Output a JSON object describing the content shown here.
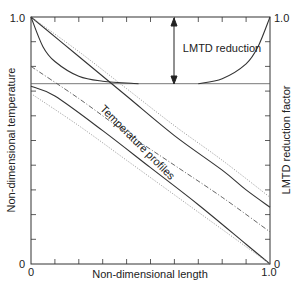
{
  "chart_data": {
    "type": "line",
    "title": "",
    "xlabel": "Non-dimensional length",
    "ylabel_left": "Non-dimensional temperature",
    "ylabel_right": "LMTD reduction factor",
    "xlim": [
      0,
      1.0
    ],
    "ylim": [
      0,
      1.0
    ],
    "x_tick_labels": [
      "0",
      "1.0"
    ],
    "y_left_tick_labels": [
      "0",
      "1.0"
    ],
    "y_right_tick_labels": [
      "0",
      "1.0"
    ],
    "x_minor_ticks": 10,
    "y_minor_ticks": 10,
    "grid": false,
    "annotations": [
      {
        "text": "LMTD reduction",
        "x": 0.58,
        "y": 0.88
      },
      {
        "text": "Temperature profiles",
        "x": 0.33,
        "y": 0.4,
        "rotation": -45
      }
    ],
    "reference_line": {
      "y": 0.73,
      "style": "thin solid"
    },
    "arrow": {
      "x": 0.6,
      "y_from": 0.73,
      "y_to": 1.0,
      "style": "double-headed"
    },
    "series": [
      {
        "name": "hot stream (solid)",
        "style": "solid",
        "x": [
          0,
          0.2,
          0.4,
          0.6,
          0.8,
          0.9,
          1.0
        ],
        "y": [
          1.0,
          0.84,
          0.68,
          0.52,
          0.38,
          0.3,
          0.23
        ]
      },
      {
        "name": "hot stream ideal (dotted)",
        "style": "dotted",
        "x": [
          0,
          0.2,
          0.4,
          0.6,
          0.8,
          1.0
        ],
        "y": [
          1.0,
          0.86,
          0.71,
          0.56,
          0.42,
          0.27
        ]
      },
      {
        "name": "mean (dash-dot)",
        "style": "dashdot",
        "x": [
          0,
          0.2,
          0.4,
          0.6,
          0.8,
          1.0
        ],
        "y": [
          0.8,
          0.67,
          0.53,
          0.4,
          0.27,
          0.13
        ]
      },
      {
        "name": "cold stream (solid)",
        "style": "solid",
        "x": [
          0,
          0.1,
          0.3,
          0.5,
          0.7,
          0.9,
          1.0
        ],
        "y": [
          0.72,
          0.68,
          0.54,
          0.39,
          0.24,
          0.08,
          0.0
        ]
      },
      {
        "name": "cold stream ideal (dotted)",
        "style": "dotted",
        "x": [
          0,
          0.2,
          0.4,
          0.6,
          0.8,
          1.0
        ],
        "y": [
          0.69,
          0.56,
          0.42,
          0.28,
          0.14,
          0.0
        ]
      },
      {
        "name": "decay curve",
        "style": "solid",
        "x": [
          0,
          0.05,
          0.1,
          0.2,
          0.3,
          0.45
        ],
        "y": [
          1.0,
          0.88,
          0.82,
          0.76,
          0.74,
          0.73
        ]
      },
      {
        "name": "LMTD reduction factor",
        "style": "solid",
        "x": [
          0.7,
          0.8,
          0.9,
          0.95,
          1.0
        ],
        "y": [
          0.73,
          0.75,
          0.81,
          0.88,
          1.0
        ]
      }
    ]
  }
}
